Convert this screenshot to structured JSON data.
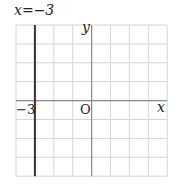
{
  "chart_data": {
    "type": "diagram",
    "title": "x=−3",
    "xlabel": "x",
    "ylabel": "y",
    "origin_label": "O",
    "grid": true,
    "xlim": [
      -4,
      4
    ],
    "ylim": [
      -4,
      4
    ],
    "lines": [
      {
        "equation": "x = -3",
        "type": "vertical",
        "x": -3,
        "style": "bold"
      }
    ],
    "tick_labels": [
      {
        "axis": "x",
        "value": -3,
        "text": "−3"
      }
    ]
  },
  "labels": {
    "equation": "x=−3",
    "x_axis": "x",
    "y_axis": "y",
    "origin": "O",
    "tick_neg3": "−3"
  },
  "colors": {
    "grid": "#d6d6d6",
    "axis": "#8a8a8a",
    "line": "#333333",
    "text": "#222222"
  },
  "geometry": {
    "left": 16,
    "top": 25,
    "cell": 18.9,
    "cols": 8,
    "rows": 8,
    "origin_col": 4,
    "origin_row": 4
  }
}
